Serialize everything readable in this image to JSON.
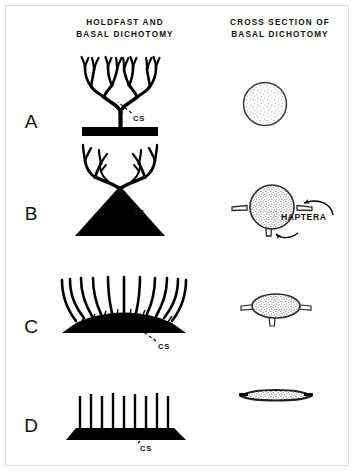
{
  "figure": {
    "background_color": "#ffffff",
    "ink_color": "#000000",
    "frame_color": "#d8d8d8",
    "headers": {
      "left_line1": "HOLDFAST   AND",
      "left_line2": "BASAL DICHOTOMY",
      "right_line1": "CROSS SECTION OF",
      "right_line2": "BASAL  DICHOTOMY"
    },
    "panels": [
      {
        "letter": "A",
        "cs_label": "CS",
        "holdfast_shape": "flat-bar",
        "cross_section_shape": "circle"
      },
      {
        "letter": "B",
        "cs_label": "CS",
        "holdfast_shape": "solid-cone",
        "cross_section_shape": "circle-with-haptera"
      },
      {
        "letter": "C",
        "cs_label": "CS",
        "holdfast_shape": "low-broad-mound",
        "cross_section_shape": "flattened-ellipse-with-haptera"
      },
      {
        "letter": "D",
        "cs_label": "CS",
        "holdfast_shape": "flat-crust",
        "cross_section_shape": "thin-lens"
      }
    ],
    "annotations": {
      "haptera_label": "HAPTERA"
    }
  }
}
